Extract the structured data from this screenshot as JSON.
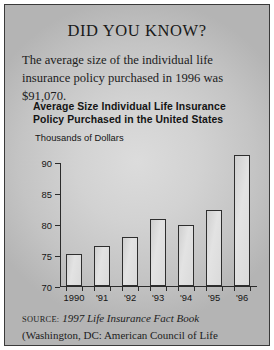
{
  "headline": "DID YOU KNOW?",
  "lede": "The average size of the individual life insurance policy purchased in 1996 was $91,070.",
  "source": {
    "label": "SOURCE:",
    "title_italic": "1997 Life Insurance Fact Book",
    "rest": "(Washington, DC:  American Council of Life Insurance), p. 13."
  },
  "chart_data": {
    "type": "bar",
    "title": "Average Size Individual Life Insurance Policy Purchased in the United States",
    "ylabel": "Thousands of Dollars",
    "xlabel": "",
    "categories": [
      "1990",
      "'91",
      "'92",
      "'93",
      "'94",
      "'95",
      "'96"
    ],
    "values": [
      75.2,
      76.5,
      77.9,
      80.8,
      79.9,
      82.2,
      91.07
    ],
    "ylim": [
      70,
      90
    ],
    "yticks": [
      70,
      75,
      80,
      85,
      90
    ],
    "ytick_labels": [
      "70",
      "75",
      "80",
      "85",
      "90"
    ],
    "grid": false,
    "legend": null,
    "bar_fill": "#dedede",
    "bar_edge": "#2e2e2e"
  }
}
